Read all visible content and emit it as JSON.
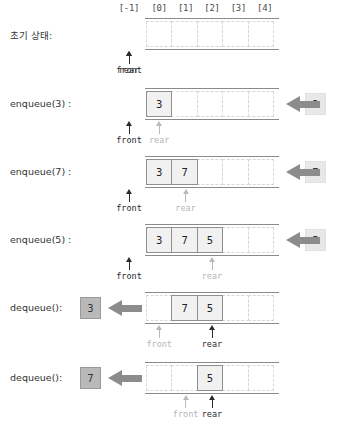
{
  "diagram": {
    "columns": [
      "[-1]",
      "[0]",
      "[1]",
      "[2]",
      "[3]",
      "[4]"
    ],
    "capacity": 5,
    "front_label": "front",
    "rear_label": "rear",
    "colors": {
      "rail": "#8a8a8a",
      "cell_border_filled": "#8f8f8f",
      "cell_fill_filled": "#f1f1f1",
      "cell_border_empty": "#d8d8d8",
      "pointer_active": "#2b2b2b",
      "pointer_dim": "#b9b9b9",
      "arrow": "#8c8c8c",
      "in_box": "#e8e8e8",
      "out_box": "#b9b9b9"
    },
    "rows": [
      {
        "op": "초기 상태:",
        "cells": [
          "",
          "",
          "",
          "",
          ""
        ],
        "front_index": -1,
        "rear_index": -1,
        "front_dim": false,
        "rear_dim": false,
        "side": null
      },
      {
        "op": "enqueue(3) :",
        "cells": [
          "3",
          "",
          "",
          "",
          ""
        ],
        "front_index": -1,
        "rear_index": 0,
        "front_dim": false,
        "rear_dim": true,
        "side": {
          "kind": "in",
          "value": "3"
        }
      },
      {
        "op": "enqueue(7) :",
        "cells": [
          "3",
          "7",
          "",
          "",
          ""
        ],
        "front_index": -1,
        "rear_index": 1,
        "front_dim": false,
        "rear_dim": true,
        "side": {
          "kind": "in",
          "value": "7"
        }
      },
      {
        "op": "enqueue(5) :",
        "cells": [
          "3",
          "7",
          "5",
          "",
          ""
        ],
        "front_index": -1,
        "rear_index": 2,
        "front_dim": false,
        "rear_dim": true,
        "side": {
          "kind": "in",
          "value": "5"
        }
      },
      {
        "op": "dequeue():",
        "cells": [
          "",
          "7",
          "5",
          "",
          ""
        ],
        "front_index": 0,
        "rear_index": 2,
        "front_dim": true,
        "rear_dim": false,
        "side": {
          "kind": "out",
          "value": "3"
        }
      },
      {
        "op": "dequeue():",
        "cells": [
          "",
          "",
          "5",
          "",
          ""
        ],
        "front_index": 1,
        "rear_index": 2,
        "front_dim": true,
        "rear_dim": false,
        "side": {
          "kind": "out",
          "value": "7"
        }
      }
    ]
  }
}
